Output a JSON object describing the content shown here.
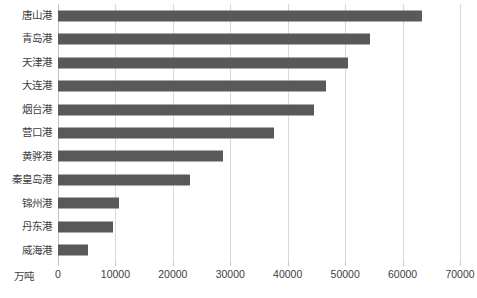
{
  "chart_data": {
    "type": "bar",
    "orientation": "horizontal",
    "title": "",
    "xlabel": "",
    "ylabel": "",
    "unit_label": "万吨",
    "categories": [
      "唐山港",
      "青岛港",
      "天津港",
      "大连港",
      "烟台港",
      "营口港",
      "黄骅港",
      "秦皇岛港",
      "锦州港",
      "丹东港",
      "威海港"
    ],
    "values": [
      63400,
      54400,
      50500,
      46700,
      44600,
      37600,
      28700,
      23000,
      10600,
      9600,
      5200
    ],
    "xlim": [
      0,
      70000
    ],
    "xticks": [
      0,
      10000,
      20000,
      30000,
      40000,
      50000,
      60000,
      70000
    ],
    "xtick_labels": [
      "0",
      "10000",
      "20000",
      "30000",
      "40000",
      "50000",
      "60000",
      "70000"
    ],
    "grid": true,
    "legend": "none",
    "bar_color": "#595959",
    "grid_color": "#d9d9d9",
    "text_color": "#404040"
  },
  "caption": ""
}
